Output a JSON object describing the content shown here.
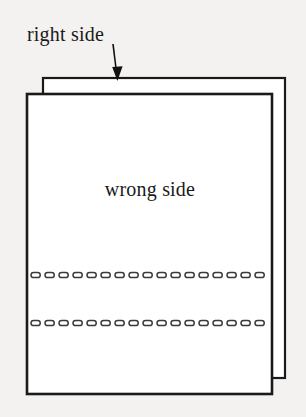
{
  "figure": {
    "title_labels": {
      "right_side": "right side",
      "wrong_side": "wrong side"
    },
    "colors": {
      "background": "#f3f2f0",
      "fabric_fill": "#ffffff",
      "outline": "#1a1a1a",
      "stitch": "#3a3a3a",
      "arrow": "#111111"
    },
    "back_sheet": {
      "name": "right-side-fabric-layer",
      "x": 43,
      "y": 78,
      "width": 242,
      "height": 300
    },
    "front_sheet": {
      "name": "wrong-side-fabric-layer",
      "x": 27,
      "y": 94,
      "width": 245,
      "height": 300
    },
    "arrow": {
      "name": "pointer-arrow",
      "from_x": 113,
      "from_y": 44,
      "to_x": 117,
      "to_y": 80
    },
    "stitch_lines": [
      {
        "name": "stitch-line-upper",
        "y": 275,
        "x_start": 31,
        "x_end": 269,
        "dash_count": 17
      },
      {
        "name": "stitch-line-lower",
        "y": 323,
        "x_start": 31,
        "x_end": 269,
        "dash_count": 17
      }
    ]
  }
}
